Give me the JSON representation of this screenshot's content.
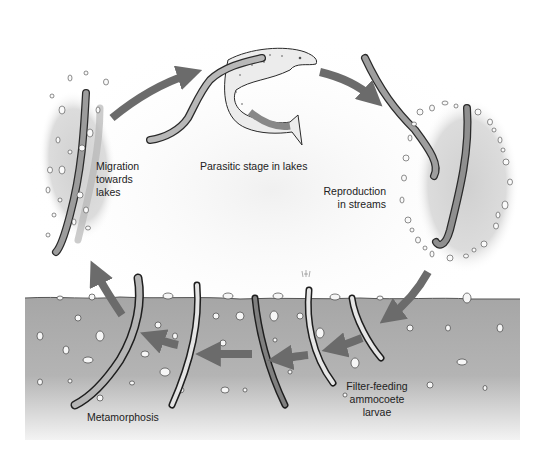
{
  "diagram": {
    "colors": {
      "arrow": "#6b6b6b",
      "sediment": "#a8a8a8",
      "sediment_fade": "#f2f2f2",
      "halo": "#d6d6d6",
      "lamprey_body": "#9a9a9a",
      "lamprey_outline": "#2a2a2a",
      "fish_body": "#ececec",
      "pebble": "#f4f4f4",
      "text": "#222222"
    },
    "stages": [
      {
        "id": "parasitic",
        "label": "Parasitic stage in lakes"
      },
      {
        "id": "reproduction",
        "label": "Reproduction\nin streams"
      },
      {
        "id": "larvae",
        "label": "Filter-feeding\nammocoete\nlarvae"
      },
      {
        "id": "metamorphosis",
        "label": "Metamorphosis"
      },
      {
        "id": "migration",
        "label": "Migration\ntowards\nlakes"
      }
    ],
    "arrows": [
      {
        "from": "migration",
        "to": "parasitic"
      },
      {
        "from": "parasitic",
        "to": "reproduction"
      },
      {
        "from": "reproduction",
        "to": "larvae"
      },
      {
        "from": "larvae",
        "to": "larvae"
      },
      {
        "from": "larvae",
        "to": "larvae"
      },
      {
        "from": "larvae",
        "to": "metamorphosis"
      },
      {
        "from": "metamorphosis",
        "to": "metamorphosis"
      },
      {
        "from": "metamorphosis",
        "to": "migration"
      }
    ]
  }
}
